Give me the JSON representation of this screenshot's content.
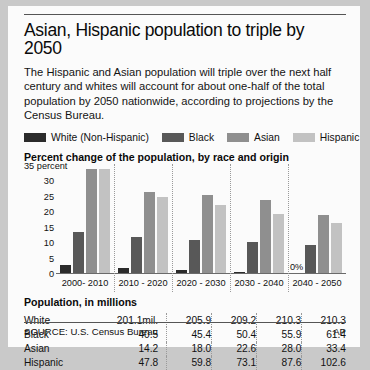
{
  "headline": "Asian, Hispanic population to triple by 2050",
  "standfirst": "The Hispanic and Asian population will triple over the next half century and whites will account for about one-half of the total population by 2050 nationwide, according to projections by the Census Bureau.",
  "legend": [
    {
      "label": "White (Non-Hispanic)",
      "color": "#2b2b2b"
    },
    {
      "label": "Black",
      "color": "#585858"
    },
    {
      "label": "Asian",
      "color": "#8f8f8f"
    },
    {
      "label": "Hispanic",
      "color": "#c2c2c2"
    }
  ],
  "chart_title": "Percent change of the population, by race and origin",
  "zero_annotation": "0%",
  "table": {
    "title": "Population, in millions",
    "rows": [
      {
        "label": "White",
        "values": [
          "201.1mil.",
          "205.9",
          "209.2",
          "210.3",
          "210.3"
        ]
      },
      {
        "label": "Black",
        "values": [
          "40.5",
          "45.4",
          "50.4",
          "55.9",
          "61.4"
        ]
      },
      {
        "label": "Asian",
        "values": [
          "14.2",
          "18.0",
          "22.6",
          "28.0",
          "33.4"
        ]
      },
      {
        "label": "Hispanic",
        "values": [
          "47.8",
          "59.8",
          "73.1",
          "87.6",
          "102.6"
        ]
      }
    ]
  },
  "footer": {
    "source": "SOURCE: U.S. Census Bureau",
    "credit": "AP"
  },
  "chart_data": {
    "type": "bar",
    "title": "Percent change of the population, by race and origin",
    "xlabel": "",
    "ylabel": "percent",
    "ylim": [
      0,
      35
    ],
    "yticks": [
      "35 percent",
      "30",
      "25",
      "20",
      "15",
      "10",
      "5",
      "0"
    ],
    "ytick_values": [
      35,
      30,
      25,
      20,
      15,
      10,
      5,
      0
    ],
    "grid": false,
    "legend_position": "top",
    "categories": [
      "2000- 2010",
      "2010 - 2020",
      "2020 - 2030",
      "2030 - 2040",
      "2040 - 2050"
    ],
    "series": [
      {
        "name": "White (Non-Hispanic)",
        "color": "#2b2b2b",
        "values": [
          3.0,
          2.0,
          1.3,
          0.5,
          0.0
        ]
      },
      {
        "name": "Black",
        "color": "#585858",
        "values": [
          13.5,
          12.0,
          11.0,
          10.5,
          9.5
        ]
      },
      {
        "name": "Asian",
        "color": "#8f8f8f",
        "values": [
          34.0,
          26.5,
          25.5,
          24.0,
          19.0
        ]
      },
      {
        "name": "Hispanic",
        "color": "#c2c2c2",
        "values": [
          34.0,
          25.0,
          22.3,
          19.5,
          16.5
        ]
      }
    ],
    "annotations": [
      {
        "text": "0%",
        "category": "2040 - 2050",
        "series": "White (Non-Hispanic)",
        "value": 0
      }
    ],
    "table": {
      "title": "Population, in millions",
      "columns": [
        "2000- 2010",
        "2010 - 2020",
        "2020 - 2030",
        "2030 - 2040",
        "2040 - 2050"
      ],
      "rows": [
        {
          "name": "White",
          "values": [
            "201.1mil.",
            "205.9",
            "209.2",
            "210.3",
            "210.3"
          ]
        },
        {
          "name": "Black",
          "values": [
            "40.5",
            "45.4",
            "50.4",
            "55.9",
            "61.4"
          ]
        },
        {
          "name": "Asian",
          "values": [
            "14.2",
            "18.0",
            "22.6",
            "28.0",
            "33.4"
          ]
        },
        {
          "name": "Hispanic",
          "values": [
            "47.8",
            "59.8",
            "73.1",
            "87.6",
            "102.6"
          ]
        }
      ]
    }
  }
}
